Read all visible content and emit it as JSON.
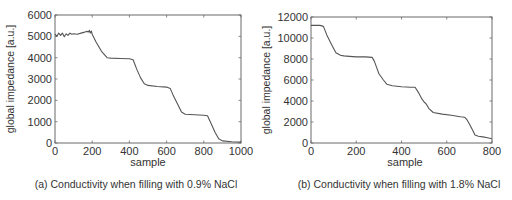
{
  "chart_data": [
    {
      "type": "line",
      "title": "",
      "caption": "(a) Conductivity when filling with 0.9% NaCl",
      "xlabel": "sample",
      "ylabel": "global impedance [a.u.]",
      "xlim": [
        0,
        1000
      ],
      "ylim": [
        0,
        6000
      ],
      "xticks": [
        0,
        200,
        400,
        600,
        800,
        1000
      ],
      "yticks": [
        0,
        1000,
        2000,
        3000,
        4000,
        5000,
        6000
      ],
      "grid": false,
      "legend": null,
      "series": [
        {
          "name": "global impedance",
          "x": [
            0,
            10,
            20,
            30,
            40,
            50,
            60,
            70,
            80,
            90,
            100,
            120,
            140,
            160,
            170,
            180,
            185,
            190,
            195,
            200,
            220,
            250,
            280,
            300,
            350,
            400,
            420,
            440,
            460,
            480,
            500,
            550,
            600,
            620,
            640,
            660,
            680,
            700,
            750,
            800,
            820,
            840,
            860,
            880,
            900,
            950,
            1000
          ],
          "y": [
            5100,
            5000,
            5150,
            5050,
            5150,
            4980,
            5120,
            5050,
            5150,
            5100,
            5120,
            5100,
            5150,
            5200,
            5230,
            5210,
            5280,
            5150,
            5250,
            5100,
            4750,
            4300,
            4000,
            3980,
            3960,
            3950,
            3900,
            3450,
            3050,
            2780,
            2700,
            2650,
            2620,
            2550,
            2150,
            1800,
            1450,
            1350,
            1320,
            1300,
            1280,
            900,
            500,
            200,
            100,
            60,
            40
          ]
        }
      ]
    },
    {
      "type": "line",
      "title": "",
      "caption": "(b) Conductivity when filling with 1.8% NaCl",
      "xlabel": "sample",
      "ylabel": "global impedance [a.u.]",
      "xlim": [
        0,
        800
      ],
      "ylim": [
        0,
        12000
      ],
      "xticks": [
        0,
        200,
        400,
        600,
        800
      ],
      "yticks": [
        0,
        2000,
        4000,
        6000,
        8000,
        10000,
        12000
      ],
      "grid": false,
      "legend": null,
      "series": [
        {
          "name": "global impedance",
          "x": [
            0,
            20,
            40,
            55,
            70,
            90,
            110,
            130,
            145,
            170,
            200,
            240,
            270,
            280,
            290,
            300,
            310,
            320,
            335,
            360,
            400,
            440,
            460,
            475,
            490,
            500,
            510,
            520,
            540,
            580,
            620,
            660,
            680,
            690,
            700,
            715,
            725,
            740,
            760,
            780,
            800
          ],
          "y": [
            11200,
            11200,
            11200,
            11100,
            10300,
            9400,
            8600,
            8350,
            8300,
            8250,
            8200,
            8200,
            8150,
            7800,
            7200,
            6600,
            6300,
            6000,
            5600,
            5450,
            5350,
            5300,
            5300,
            4800,
            4200,
            3900,
            3700,
            3300,
            2900,
            2750,
            2650,
            2500,
            2450,
            2200,
            1800,
            1200,
            750,
            650,
            580,
            500,
            400
          ]
        }
      ]
    }
  ],
  "panels": [
    {
      "caption": "(a) Conductivity when filling with 0.9% NaCl",
      "xlabel": "sample",
      "ylabel": "global impedance [a.u.]"
    },
    {
      "caption": "(b) Conductivity when filling with 1.8% NaCl",
      "xlabel": "sample",
      "ylabel": "global impedance [a.u.]"
    }
  ],
  "colors": {
    "line": "#555555",
    "axis": "#6b6b6b",
    "text": "#333333"
  }
}
